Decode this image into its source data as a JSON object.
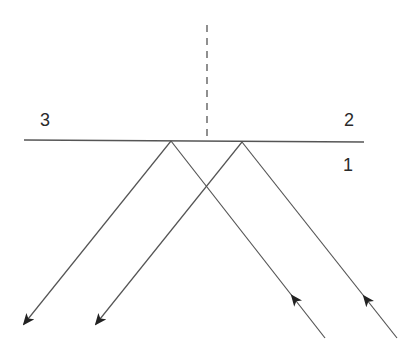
{
  "diagram": {
    "type": "ray-reflection-interface",
    "colors": {
      "line": "#555555",
      "arrow": "#222222",
      "text": "#2a2a2a",
      "background": "#ffffff"
    },
    "labels": {
      "medium_3": "3",
      "medium_2": "2",
      "medium_1": "1"
    },
    "interface": {
      "x1": 24,
      "y1": 140,
      "x2": 364,
      "y2": 142
    },
    "normal": {
      "x": 207,
      "y1": 25,
      "y2": 141,
      "style": "dashed"
    },
    "rays": [
      {
        "name": "incident-ray-a",
        "direction": "up",
        "from": [
          325,
          338
        ],
        "to": [
          171,
          141
        ]
      },
      {
        "name": "incident-ray-b",
        "direction": "up",
        "from": [
          397,
          338
        ],
        "to": [
          242,
          142
        ]
      },
      {
        "name": "reflected-ray-a",
        "direction": "down-left",
        "from": [
          171,
          141
        ],
        "to": [
          24,
          324
        ]
      },
      {
        "name": "reflected-ray-b",
        "direction": "down-left",
        "from": [
          242,
          142
        ],
        "to": [
          96,
          324
        ]
      }
    ]
  }
}
